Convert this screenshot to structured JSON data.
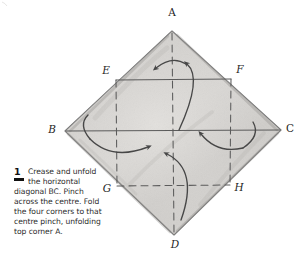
{
  "figure": {
    "type": "origami-instruction-diagram",
    "shape": "square-sheet-rotated-45-degrees",
    "paper_fill": "#d9d7d4",
    "ink_color": "#3c3c3c",
    "vertices": [
      {
        "label": "A",
        "role": "top-corner",
        "x": 172,
        "y": 31
      },
      {
        "label": "B",
        "role": "left-corner",
        "x": 65,
        "y": 131
      },
      {
        "label": "C",
        "role": "right-corner",
        "x": 281,
        "y": 130
      },
      {
        "label": "D",
        "role": "bottom-corner",
        "x": 174,
        "y": 235
      }
    ],
    "interior_points": [
      {
        "label": "E",
        "role": "upper-left-crease-node",
        "x": 116,
        "y": 80
      },
      {
        "label": "F",
        "role": "upper-right-crease-node",
        "x": 231,
        "y": 79
      },
      {
        "label": "G",
        "role": "lower-left-crease-node",
        "x": 117,
        "y": 186
      },
      {
        "label": "H",
        "role": "lower-right-crease-node",
        "x": 230,
        "y": 185
      }
    ],
    "point_labels": [
      {
        "text": "A",
        "x": 172,
        "y": 16,
        "style": "upright"
      },
      {
        "text": "E",
        "x": 106,
        "y": 74,
        "style": "italic"
      },
      {
        "text": "F",
        "x": 240,
        "y": 73,
        "style": "italic"
      },
      {
        "text": "B",
        "x": 52,
        "y": 133,
        "style": "italic"
      },
      {
        "text": "C",
        "x": 290,
        "y": 132,
        "style": "upright"
      },
      {
        "text": "G",
        "x": 107,
        "y": 192,
        "style": "italic"
      },
      {
        "text": "H",
        "x": 239,
        "y": 191,
        "style": "italic"
      },
      {
        "text": "D",
        "x": 175,
        "y": 248,
        "style": "italic"
      }
    ],
    "creases": [
      {
        "name": "horizontal-diagonal-BC",
        "style": "solid",
        "from": "B",
        "to": "C"
      },
      {
        "name": "crease-EF",
        "style": "solid",
        "from": "E",
        "to": "F"
      },
      {
        "name": "vertical-diagonal-AD",
        "style": "dashed",
        "from": "A",
        "to": "D"
      },
      {
        "name": "crease-GH",
        "style": "dashed",
        "from": "G",
        "to": "H"
      },
      {
        "name": "crease-EG",
        "style": "dashed",
        "from": "E",
        "to": "G"
      },
      {
        "name": "crease-FH",
        "style": "dashed",
        "from": "F",
        "to": "H"
      }
    ],
    "arrows": [
      {
        "name": "fold-arrow-top",
        "direction": "up-left-to-centre",
        "description": "corner A folding down to centre and unfolding"
      },
      {
        "name": "fold-arrow-bottom",
        "direction": "up-to-centre",
        "description": "corner D folding up to centre pinch"
      },
      {
        "name": "fold-arrow-left",
        "direction": "right-to-centre",
        "description": "corner B folding right to centre pinch"
      },
      {
        "name": "fold-arrow-right",
        "direction": "left-to-centre",
        "description": "corner C folding left to centre pinch"
      }
    ]
  },
  "caption": {
    "step_number": "1",
    "text": "Crease and unfold the horizontal diagonal BC. Pinch across the centre. Fold the four corners to that centre pinch, unfolding top corner A."
  }
}
